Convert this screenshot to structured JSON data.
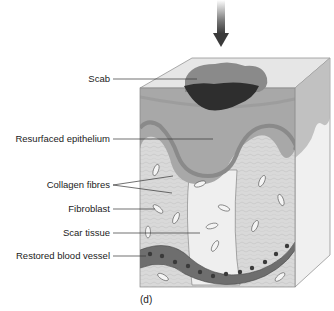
{
  "figure": {
    "caption": "(d)",
    "labels": [
      {
        "id": "scab",
        "text": "Scab"
      },
      {
        "id": "resurfaced-epithelium",
        "text": "Resurfaced epithelium"
      },
      {
        "id": "collagen-fibres",
        "text": "Collagen fibres"
      },
      {
        "id": "fibroblast",
        "text": "Fibroblast"
      },
      {
        "id": "scar-tissue",
        "text": "Scar tissue"
      },
      {
        "id": "restored-blood-vessel",
        "text": "Restored blood vessel"
      }
    ],
    "arrow": "down-arrow",
    "colors": {
      "scab_dark": "#2e2e2e",
      "scab_light": "#8a8a8a",
      "epidermis": "#a8a8a8",
      "epidermis_band": "#8f8f8f",
      "dermis": "#d9d9d9",
      "scar": "#eeeeee",
      "vessel": "#6e6e6e",
      "vessel_cells": "#3a3a3a",
      "top_face": "#e6e6e6",
      "side_face": "#f0f0f0"
    }
  }
}
